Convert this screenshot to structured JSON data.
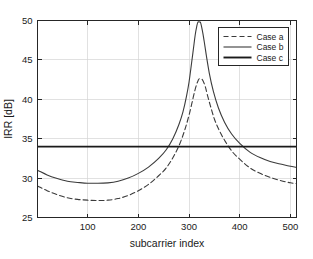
{
  "chart_data": {
    "type": "line",
    "title": "",
    "xlabel": "subcarrier index",
    "ylabel": "IRR [dB]",
    "xlim": [
      1,
      512
    ],
    "ylim": [
      25,
      50
    ],
    "xticks": [
      100,
      200,
      300,
      400,
      500
    ],
    "yticks": [
      25,
      30,
      35,
      40,
      45,
      50
    ],
    "xtick_labels": [
      "100",
      "200",
      "300",
      "400",
      "500"
    ],
    "ytick_labels": [
      "25",
      "30",
      "35",
      "40",
      "45",
      "50"
    ],
    "grid": true,
    "legend_position": "upper right",
    "legend_entries": [
      "Case a",
      "Case b",
      "Case c"
    ],
    "series": [
      {
        "name": "Case a",
        "style": "dashed",
        "x": [
          1,
          20,
          40,
          60,
          80,
          100,
          120,
          140,
          160,
          180,
          200,
          220,
          240,
          255,
          270,
          282,
          292,
          300,
          306,
          311,
          315,
          318,
          320,
          324,
          328,
          332,
          336,
          342,
          350,
          360,
          372,
          386,
          400,
          420,
          440,
          460,
          480,
          500,
          512
        ],
        "values": [
          29.0,
          28.4,
          27.9,
          27.5,
          27.3,
          27.2,
          27.15,
          27.2,
          27.4,
          27.8,
          28.4,
          29.2,
          30.3,
          31.3,
          32.8,
          34.4,
          36.2,
          38.0,
          39.6,
          41.0,
          41.9,
          42.4,
          42.6,
          42.6,
          42.3,
          41.6,
          40.6,
          39.2,
          37.5,
          36.0,
          34.6,
          33.3,
          32.4,
          31.3,
          30.6,
          30.1,
          29.7,
          29.4,
          29.3
        ]
      },
      {
        "name": "Case b",
        "style": "solid",
        "x": [
          1,
          20,
          40,
          60,
          80,
          100,
          120,
          140,
          160,
          180,
          200,
          220,
          240,
          255,
          268,
          280,
          288,
          295,
          300,
          305,
          309,
          312,
          315,
          318,
          322,
          326,
          330,
          334,
          340,
          348,
          358,
          370,
          384,
          400,
          420,
          440,
          460,
          480,
          500,
          512
        ],
        "values": [
          31.0,
          30.4,
          29.95,
          29.6,
          29.45,
          29.35,
          29.35,
          29.4,
          29.6,
          30.0,
          30.6,
          31.4,
          32.5,
          33.6,
          35.0,
          36.8,
          38.4,
          40.4,
          42.2,
          44.6,
          46.6,
          48.1,
          49.2,
          49.85,
          49.8,
          48.8,
          47.3,
          45.6,
          43.3,
          41.0,
          38.9,
          37.1,
          35.6,
          34.4,
          33.3,
          32.6,
          32.1,
          31.8,
          31.5,
          31.35
        ]
      },
      {
        "name": "Case c",
        "style": "solid-thick",
        "x": [
          1,
          512
        ],
        "values": [
          34.0,
          34.0
        ]
      }
    ]
  },
  "colors": {
    "series_a": "#3b3b3b",
    "series_b": "#3b3b3b",
    "series_c": "#1a1a1a",
    "axis": "#262626",
    "grid": "#d4d4d4",
    "background": "#ffffff"
  }
}
